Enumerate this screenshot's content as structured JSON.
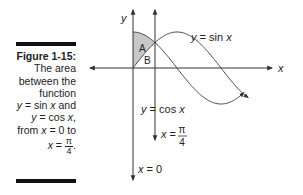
{
  "figure": {
    "label": "Figure 1-15:",
    "caption_lines": [
      "The area",
      "between the",
      "function"
    ],
    "caption_fn1_var": "y",
    "caption_fn1_rest": " = sin ",
    "caption_fn1_x": "x",
    "caption_fn1_end": " and",
    "caption_fn2_var": "y",
    "caption_fn2_rest": " = cos ",
    "caption_fn2_x": "x",
    "caption_fn2_end": ",",
    "caption_from": "from ",
    "caption_from_x": "x",
    "caption_from_eq": " = 0 to",
    "caption_to_x": "x",
    "caption_to_eq": " = ",
    "caption_to_num": "π",
    "caption_to_den": "4",
    "caption_to_end": "."
  },
  "graph": {
    "y_axis_label": "y",
    "x_axis_label": "x",
    "region_a_label": "A",
    "region_b_label": "B",
    "sin_label_var": "y",
    "sin_label_rest": " = sin ",
    "sin_label_x": "x",
    "cos_label_var": "y",
    "cos_label_rest": " = cos ",
    "cos_label_x": "x",
    "line_pi4_var": "x",
    "line_pi4_eq": " = ",
    "line_pi4_num": "π",
    "line_pi4_den": "4",
    "line_zero_var": "x",
    "line_zero_eq": " = 0",
    "fill_color": "#c8c8c8",
    "line_color": "#333333"
  }
}
